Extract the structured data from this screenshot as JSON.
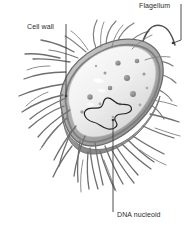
{
  "figure": {
    "style": "grayscale scientific illustration",
    "background_color": "#ffffff"
  },
  "labels": {
    "flagellum": "Flagellum",
    "cell_wall": "Cell wall",
    "dna_nucleoid": "DNA nucleoid"
  },
  "colors": {
    "label_text": "#2b2b2b",
    "leader_line": "#3a3a3a",
    "cell_wall_outer": "#6f6f6f",
    "cell_wall_mid": "#9a9a9a",
    "cytoplasm_light": "#f0f0f0",
    "cytoplasm_shade": "#d6d6d6",
    "ribosome": "#8a8a8a",
    "nucleoid_outline": "#262626",
    "pili": "#6b6b6b",
    "flagellum_stroke": "#4a4a4a",
    "cut_face": "#b5b5b5"
  },
  "structures": {
    "cell_body": "ovoid rod-shaped cell, tilted, cut away on near side",
    "pili": "numerous fine hair-like fimbriae radiating from cell surface",
    "flagellum": "single long wavy whip-like appendage at upper right pole",
    "ribosomes": "scattered dark dots within cytoplasm",
    "nucleoid": "irregular closed looped DNA strand in lower cytoplasm"
  }
}
